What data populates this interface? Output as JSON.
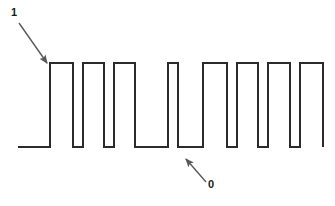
{
  "figure": {
    "type": "digital-waveform-diagram",
    "width": 335,
    "height": 206,
    "background_color": "#ffffff"
  },
  "annotations": [
    {
      "id": "high-level",
      "label": "1",
      "meaning": "logic high level",
      "label_x": 11,
      "label_y": 7,
      "arrow_from_x": 19,
      "arrow_from_y": 23,
      "arrow_to_x": 48,
      "arrow_to_y": 64,
      "color": "#595959"
    },
    {
      "id": "low-level",
      "label": "0",
      "meaning": "logic low level",
      "label_x": 208,
      "label_y": 179,
      "arrow_from_x": 206,
      "arrow_from_y": 182,
      "arrow_to_x": 185,
      "arrow_to_y": 158,
      "color": "#595959"
    }
  ],
  "chart_data": {
    "type": "line",
    "xlabel": "",
    "ylabel": "",
    "grid": false,
    "legend": null,
    "y_levels": {
      "low_label": "0",
      "high_label": "1",
      "low_pixel_y": 147,
      "high_pixel_y": 63
    },
    "line_color": "#2b2b2b",
    "line_width": 2,
    "x_range_pixels": [
      18,
      323
    ],
    "edges_pixel_x": [
      50,
      73,
      83,
      104,
      114,
      135,
      168,
      178,
      203,
      227,
      237,
      258,
      268,
      290,
      300,
      323
    ],
    "bit_sequence": [
      0,
      1,
      0,
      1,
      0,
      1,
      0,
      1,
      0,
      0,
      1,
      0,
      1,
      0,
      1,
      0,
      1
    ],
    "points": [
      [
        18,
        0
      ],
      [
        50,
        0
      ],
      [
        50,
        1
      ],
      [
        73,
        1
      ],
      [
        73,
        0
      ],
      [
        83,
        0
      ],
      [
        83,
        1
      ],
      [
        104,
        1
      ],
      [
        104,
        0
      ],
      [
        114,
        0
      ],
      [
        114,
        1
      ],
      [
        135,
        1
      ],
      [
        135,
        0
      ],
      [
        168,
        0
      ],
      [
        168,
        1
      ],
      [
        178,
        1
      ],
      [
        178,
        0
      ],
      [
        203,
        0
      ],
      [
        203,
        1
      ],
      [
        227,
        1
      ],
      [
        227,
        0
      ],
      [
        237,
        0
      ],
      [
        237,
        1
      ],
      [
        258,
        1
      ],
      [
        258,
        0
      ],
      [
        268,
        0
      ],
      [
        268,
        1
      ],
      [
        290,
        1
      ],
      [
        290,
        0
      ],
      [
        300,
        0
      ],
      [
        300,
        1
      ],
      [
        323,
        1
      ],
      [
        323,
        0
      ]
    ],
    "pulses": [
      {
        "index": 1,
        "rise_x": 50,
        "fall_x": 73,
        "width": 23
      },
      {
        "index": 2,
        "rise_x": 83,
        "fall_x": 104,
        "width": 21
      },
      {
        "index": 3,
        "rise_x": 114,
        "fall_x": 135,
        "width": 21
      },
      {
        "index": 4,
        "rise_x": 147,
        "fall_x": 168,
        "width": 21
      },
      {
        "index": 5,
        "rise_x": 203,
        "fall_x": 227,
        "width": 24
      },
      {
        "index": 6,
        "rise_x": 237,
        "fall_x": 258,
        "width": 21
      },
      {
        "index": 7,
        "rise_x": 268,
        "fall_x": 290,
        "width": 22
      },
      {
        "index": 8,
        "rise_x": 300,
        "fall_x": 323,
        "width": 23
      }
    ],
    "gaps": [
      {
        "index": 0,
        "start_x": 18,
        "end_x": 50,
        "width": 32,
        "note": "leading low baseline"
      },
      {
        "index": 1,
        "start_x": 73,
        "end_x": 83,
        "width": 10
      },
      {
        "index": 2,
        "start_x": 104,
        "end_x": 114,
        "width": 10
      },
      {
        "index": 3,
        "start_x": 135,
        "end_x": 147,
        "width": 12
      },
      {
        "index": 4,
        "start_x": 168,
        "end_x": 203,
        "width": 35,
        "note": "wide low interval"
      },
      {
        "index": 5,
        "start_x": 227,
        "end_x": 237,
        "width": 10
      },
      {
        "index": 6,
        "start_x": 258,
        "end_x": 268,
        "width": 10
      },
      {
        "index": 7,
        "start_x": 290,
        "end_x": 300,
        "width": 10
      }
    ]
  }
}
